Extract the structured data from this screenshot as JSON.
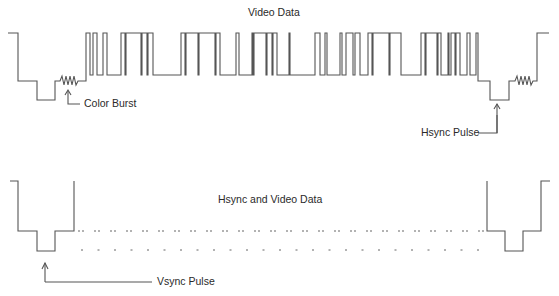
{
  "diagram": {
    "title_top": "Video Data",
    "title_bottom": "Hsync and Video Data",
    "labels": {
      "color_burst": "Color Burst",
      "hsync_pulse": "Hsync Pulse",
      "vsync_pulse": "Vsync Pulse"
    },
    "stroke_color": "#555555",
    "waveforms": {
      "horizontal_line": {
        "description": "Blanking level, sync pulse, color burst, video data, then next hsync pulse and color burst",
        "levels": {
          "high": 33,
          "blank": 81,
          "sync": 100,
          "data_low": 75
        }
      },
      "vertical_field": {
        "description": "Vsync pulse, repeated hsync and video data (dashed), then next vsync pulse"
      }
    }
  }
}
